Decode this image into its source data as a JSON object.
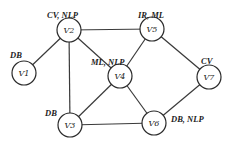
{
  "diagram": {
    "nodes": [
      {
        "id": "V1",
        "label": "V1",
        "tag": "DB",
        "x": 24,
        "y": 73,
        "tx": 10,
        "ty": 52
      },
      {
        "id": "V2",
        "label": "V2",
        "tag": "CV, NLP",
        "x": 69,
        "y": 30,
        "tx": 47,
        "ty": 12
      },
      {
        "id": "V3",
        "label": "V3",
        "tag": "DB",
        "x": 70,
        "y": 125,
        "tx": 45,
        "ty": 110
      },
      {
        "id": "V4",
        "label": "V4",
        "tag": "ML, NLP",
        "x": 120,
        "y": 76,
        "tx": 91,
        "ty": 59
      },
      {
        "id": "V5",
        "label": "V5",
        "tag": "IR, ML",
        "x": 152,
        "y": 29,
        "tx": 138,
        "ty": 12
      },
      {
        "id": "V6",
        "label": "V6",
        "tag": "DB, NLP",
        "x": 154,
        "y": 123,
        "tx": 171,
        "ty": 116
      },
      {
        "id": "V7",
        "label": "V7",
        "tag": "CV",
        "x": 209,
        "y": 77,
        "tx": 201,
        "ty": 58
      }
    ],
    "edges": [
      [
        "V1",
        "V2"
      ],
      [
        "V2",
        "V5"
      ],
      [
        "V2",
        "V3"
      ],
      [
        "V2",
        "V4"
      ],
      [
        "V4",
        "V5"
      ],
      [
        "V5",
        "V7"
      ],
      [
        "V4",
        "V3"
      ],
      [
        "V4",
        "V6"
      ],
      [
        "V3",
        "V6"
      ],
      [
        "V6",
        "V7"
      ]
    ],
    "node_radius": 12
  }
}
